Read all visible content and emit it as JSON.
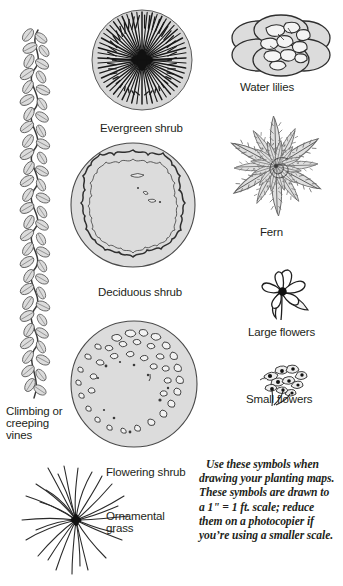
{
  "figure": {
    "kind": "planting-map-symbol-legend",
    "background_color": "#ffffff",
    "ink_color": "#231f20",
    "fill_gray": "#dcdcdc"
  },
  "symbols": [
    {
      "id": "climbing-creeping-vines",
      "icon_name": "vine-with-leaves-icon",
      "label": "Climbing or\ncreeping\nvines"
    },
    {
      "id": "evergreen-shrub",
      "icon_name": "radiating-needles-circle-icon",
      "label": "Evergreen shrub"
    },
    {
      "id": "deciduous-shrub",
      "icon_name": "scalloped-ring-circle-icon",
      "label": "Deciduous shrub"
    },
    {
      "id": "flowering-shrub",
      "icon_name": "speckled-blossom-circle-icon",
      "label": "Flowering shrub"
    },
    {
      "id": "ornamental-grass",
      "icon_name": "radiating-grass-blades-icon",
      "label": "Ornamental\ngrass"
    },
    {
      "id": "water-lilies",
      "icon_name": "overlapping-lily-pads-icon",
      "label": "Water lilies"
    },
    {
      "id": "fern",
      "icon_name": "star-frond-rosette-icon",
      "label": "Fern"
    },
    {
      "id": "large-flowers",
      "icon_name": "single-large-blossom-icon",
      "label": "Large flowers"
    },
    {
      "id": "small-flowers",
      "icon_name": "blossom-cluster-icon",
      "label": "Small flowers"
    }
  ],
  "note": {
    "text": "Use these symbols when drawing your planting maps. These symbols are drawn to a 1\" = 1 ft. scale; reduce them on a photocopier if you’re using a smaller scale."
  }
}
